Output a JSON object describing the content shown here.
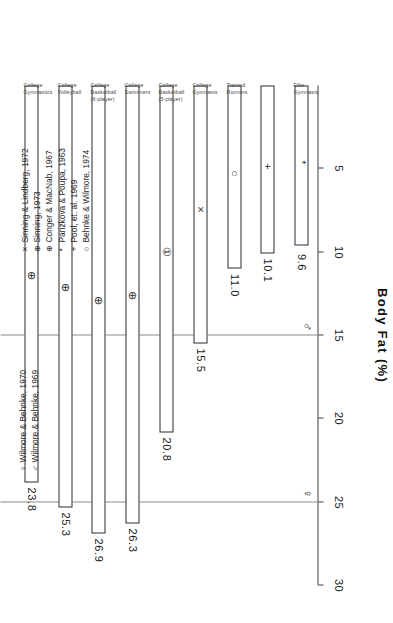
{
  "chart_data": {
    "type": "bar",
    "orientation": "horizontal",
    "title": "",
    "xlabel": "Body Fat (%)",
    "ylabel": "",
    "xlim": [
      0,
      30
    ],
    "x_ticks": [
      "30",
      "25",
      "20",
      "15",
      "10",
      "5"
    ],
    "x_tick_values": [
      30,
      25,
      20,
      15,
      10,
      5
    ],
    "x_axis_reversed": true,
    "grid": false,
    "categories": [
      "Elite Gymnasts",
      "Elite Gymnasts",
      "Trained Runners",
      "College Gymnasts",
      "College Basketball (5-player)",
      "College Swimmers",
      "College Basketball (6-player)",
      "College Volleyball",
      "College Gymnastics"
    ],
    "category_labels": [
      {
        "line1": "Elite",
        "line2": "Gymnasts"
      },
      {
        "line1": "",
        "line2": ""
      },
      {
        "line1": "Trained",
        "line2": "Runners"
      },
      {
        "line1": "College",
        "line2": "Gymnasts"
      },
      {
        "line1": "College",
        "line2": "Basketball",
        "line3": "(5-player)"
      },
      {
        "line1": "College",
        "line2": "Swimmers"
      },
      {
        "line1": "College",
        "line2": "Basketball",
        "line3": "(6-player)"
      },
      {
        "line1": "College",
        "line2": "Volleyball"
      },
      {
        "line1": "College",
        "line2": "Gymnastics"
      }
    ],
    "values": [
      9.6,
      10.1,
      11.0,
      15.5,
      20.8,
      26.3,
      26.9,
      25.3,
      23.8
    ],
    "value_labels": [
      "9.6",
      "10.1",
      "11.0",
      "15.5",
      "20.8",
      "26.3",
      "26.9",
      "25.3",
      "23.8"
    ],
    "markers": [
      "*",
      "+",
      "○",
      "×",
      "①",
      "⊕",
      "⊕",
      "⊕",
      "⊕"
    ],
    "reference_lines": [
      {
        "value": 25,
        "symbol": "♀"
      },
      {
        "value": 15,
        "symbol": "♂"
      }
    ]
  },
  "legend_top": {
    "items": [
      {
        "symbol": "♀",
        "label": "Wilmore & Behnke, 1970"
      },
      {
        "symbol": "♂",
        "label": "Wilmore & Behnke, 1969"
      }
    ]
  },
  "legend_bottom": {
    "items": [
      {
        "symbol": "×",
        "label": "Sinning & Lindberg, 1972"
      },
      {
        "symbol": "⊕",
        "label": "Sinning, 1973"
      },
      {
        "symbol": "⊕",
        "label": "Conger & MacNab, 1967"
      },
      {
        "symbol": "*",
        "label": "Parizkova & Poupa, 1963"
      },
      {
        "symbol": "+",
        "label": "Pool, et. al. 1969"
      },
      {
        "symbol": "○",
        "label": "Behnke & Wilmore, 1974"
      }
    ]
  },
  "colors": {
    "bar_stroke": "#2b2b2b",
    "bar_fill": "#ffffff",
    "axis": "#3a3a3a",
    "refline": "#8a8a8a",
    "text": "#1a1a1a",
    "background": "#ffffff"
  }
}
